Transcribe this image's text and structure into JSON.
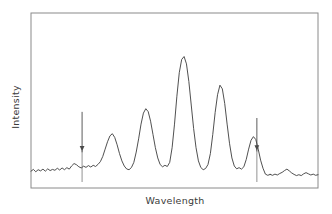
{
  "figure": {
    "kind": "spectrum-plot",
    "background": "#ffffff",
    "frame_color": "#8a8a8a",
    "trace_color": "#3c3c3c",
    "arrow_color": "#4a4a4a"
  },
  "labels": {
    "ylabel": "Intensity",
    "xlabel": "Wavelength"
  },
  "chart_data": {
    "type": "line",
    "title": "",
    "xlabel": "Wavelength",
    "ylabel": "Intensity",
    "xlim": [
      0,
      100
    ],
    "ylim": [
      0,
      100
    ],
    "grid": false,
    "legend": "none",
    "axis_ticks": "none",
    "tick_labels": "none",
    "series": [
      {
        "name": "spectrum",
        "color": "#3c3c3c",
        "x": [
          0.0,
          1.0,
          2.0,
          3.0,
          4.0,
          5.0,
          6.0,
          7.0,
          8.0,
          9.0,
          10.0,
          11.0,
          12.0,
          13.0,
          14.0,
          15.0,
          16.0,
          17.0,
          18.0,
          19.0,
          20.0,
          21.0,
          22.0,
          23.0,
          24.0,
          25.0,
          26.0,
          27.0,
          28.0,
          29.0,
          30.0,
          31.0,
          32.0,
          33.0,
          34.0,
          35.0,
          36.0,
          37.0,
          38.0,
          39.0,
          40.0,
          41.0,
          42.0,
          43.0,
          44.0,
          45.0,
          46.0,
          47.0,
          48.0,
          49.0,
          50.0,
          51.0,
          52.0,
          53.0,
          54.0,
          55.0,
          56.0,
          57.0,
          58.0,
          59.0,
          60.0,
          61.0,
          62.0,
          63.0,
          64.0,
          65.0,
          66.0,
          67.0,
          68.0,
          69.0,
          70.0,
          71.0,
          72.0,
          73.0,
          74.0,
          75.0,
          76.0,
          77.0,
          78.0,
          79.0,
          80.0,
          81.0,
          82.0,
          83.0,
          84.0,
          85.0,
          86.0,
          87.0,
          88.0,
          89.0,
          90.0,
          91.0,
          92.0,
          93.0,
          94.0,
          95.0,
          96.0,
          97.0,
          98.0,
          99.0,
          100.0
        ],
        "y": [
          6.0,
          7.2,
          5.6,
          7.0,
          6.2,
          7.4,
          6.0,
          7.6,
          6.4,
          7.2,
          6.6,
          8.0,
          6.8,
          8.2,
          7.0,
          8.4,
          7.4,
          9.6,
          11.2,
          10.4,
          9.0,
          8.2,
          9.4,
          8.6,
          9.8,
          8.8,
          10.0,
          9.2,
          10.6,
          12.5,
          16.0,
          21.0,
          26.0,
          30.0,
          31.5,
          29.0,
          24.0,
          18.0,
          13.0,
          9.5,
          7.5,
          7.0,
          8.5,
          12.0,
          19.0,
          28.0,
          38.0,
          45.5,
          48.5,
          46.5,
          40.0,
          31.0,
          22.0,
          15.0,
          10.5,
          9.0,
          10.0,
          9.2,
          12.0,
          22.0,
          38.0,
          57.0,
          73.0,
          82.0,
          84.0,
          79.0,
          67.0,
          51.0,
          35.0,
          22.0,
          13.0,
          8.5,
          7.0,
          7.8,
          10.5,
          18.0,
          31.0,
          46.0,
          58.0,
          64.5,
          62.0,
          52.0,
          38.0,
          25.0,
          15.0,
          9.5,
          7.6,
          8.4,
          7.4,
          9.0,
          14.0,
          21.0,
          27.0,
          29.5,
          27.5,
          21.0,
          13.5,
          8.0,
          4.0,
          3.2,
          3.8
        ]
      },
      {
        "name": "spectrum-tail",
        "color": "#3c3c3c",
        "x": [
          100.0,
          101.0,
          102.0,
          103.0,
          104.0,
          105.0,
          106.0,
          107.0,
          108.0,
          109.0,
          110.0,
          111.0,
          112.0,
          113.0,
          114.0,
          115.0,
          116.0,
          117.0,
          118.0,
          119.0,
          120.0
        ],
        "y": [
          3.8,
          3.2,
          4.0,
          3.4,
          4.4,
          5.2,
          6.4,
          7.4,
          6.2,
          4.8,
          3.8,
          3.0,
          3.6,
          3.0,
          4.2,
          5.0,
          4.2,
          3.4,
          4.0,
          3.2,
          3.6
        ]
      }
    ],
    "annotations": [
      {
        "type": "arrow",
        "direction": "down",
        "name": "left-marker-arrow",
        "x_fraction": 0.178,
        "head_y_fraction": 0.79,
        "tail_y_fraction": 0.565,
        "label": ""
      },
      {
        "type": "arrow",
        "direction": "down",
        "name": "right-marker-arrow",
        "x_fraction": 0.787,
        "head_y_fraction": 0.785,
        "tail_y_fraction": 0.6,
        "label": ""
      }
    ],
    "peaks": [
      {
        "index": 1,
        "x": 34.0,
        "height": 31.5,
        "label": "band-1"
      },
      {
        "index": 2,
        "x": 48.0,
        "height": 48.5,
        "label": "band-2"
      },
      {
        "index": 3,
        "x": 64.0,
        "height": 84.0,
        "label": "band-3"
      },
      {
        "index": 4,
        "x": 80.0,
        "height": 64.5,
        "label": "band-4"
      },
      {
        "index": 5,
        "x": 93.0,
        "height": 29.5,
        "label": "band-5"
      },
      {
        "index": 6,
        "x": 107.0,
        "height": 7.4,
        "label": "band-6"
      }
    ]
  }
}
